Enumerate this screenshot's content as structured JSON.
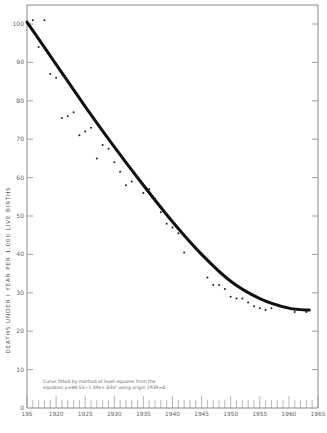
{
  "chart_data": {
    "type": "scatter",
    "title": "",
    "xlabel": "",
    "ylabel": "DEATHS UNDER I YEAR PER 1,000 LIVE BIRTHS",
    "xlim": [
      1915,
      1965
    ],
    "ylim": [
      0,
      100
    ],
    "x_ticks": [
      1915,
      1920,
      1925,
      1930,
      1935,
      1940,
      1945,
      1950,
      1955,
      1960,
      1965
    ],
    "x_tick_labels": [
      "195",
      "1920",
      "1925",
      "1930",
      "1935",
      "1940",
      "1945",
      "1950",
      "1955",
      "1960",
      "1965"
    ],
    "y_ticks": [
      0,
      10,
      20,
      30,
      40,
      50,
      60,
      70,
      80,
      90,
      100
    ],
    "grid": false,
    "legend": null,
    "series": [
      {
        "name": "Observed infant mortality rate",
        "type": "scatter",
        "x": [
          1916,
          1917,
          1918,
          1919,
          1920,
          1921,
          1922,
          1923,
          1924,
          1925,
          1926,
          1927,
          1928,
          1929,
          1930,
          1931,
          1932,
          1933,
          1934,
          1935,
          1936,
          1937,
          1938,
          1939,
          1940,
          1941,
          1942,
          1946,
          1947,
          1948,
          1949,
          1950,
          1951,
          1952,
          1953,
          1954,
          1955,
          1956,
          1957,
          1961,
          1963
        ],
        "y": [
          101,
          94,
          101,
          87,
          86,
          75.5,
          76,
          77,
          71,
          72,
          73,
          65,
          68.5,
          67.5,
          64,
          61.5,
          58,
          59,
          60,
          56,
          57,
          54.5,
          51,
          48,
          47,
          45.5,
          40.5,
          34,
          32,
          32,
          31,
          29,
          28.5,
          28.5,
          27.5,
          26.5,
          26,
          25.5,
          26,
          25,
          25
        ]
      },
      {
        "name": "Least-squares fitted curve",
        "type": "line",
        "x": [
          1915,
          1920,
          1925,
          1930,
          1935,
          1940,
          1945,
          1950,
          1955,
          1960,
          1963.5
        ],
        "y": [
          100.5,
          89.5,
          78.5,
          68,
          58,
          48.5,
          40,
          33,
          28.5,
          26,
          25.5
        ]
      }
    ],
    "annotations": [
      "Curve fitted by method of least squares from the",
      "equation y=46.53−1.59x+.03x² using origin 1939=0"
    ]
  },
  "axis": {
    "ylabel": "DEATHS   UNDER  I YEAR   PER  1,000  LIVE  BIRTHS"
  },
  "note": {
    "line1": "Curve fitted by method of least squares from the",
    "line2": "equation y=46.53−1.59x+.03x² using origin 1939=0"
  }
}
